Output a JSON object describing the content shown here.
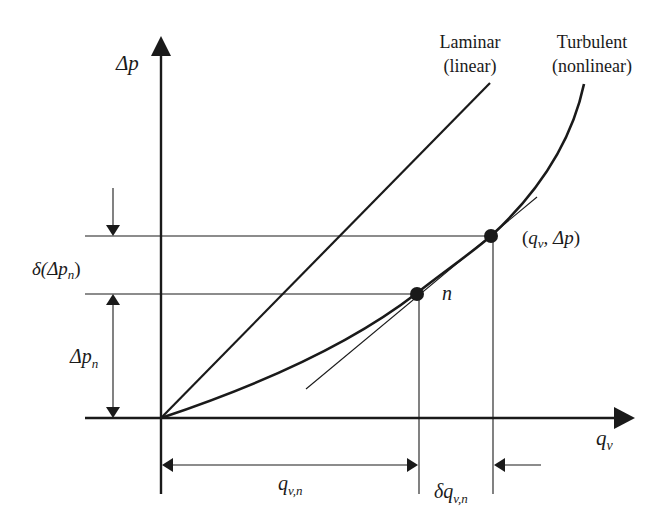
{
  "diagram": {
    "type": "pressure-flow characteristic with linearization",
    "axes": {
      "y_label": "Δp",
      "x_label_main": "q",
      "x_label_sub": "v"
    },
    "curves": {
      "laminar": {
        "line1": "Laminar",
        "line2": "(linear)"
      },
      "turbulent": {
        "line1": "Turbulent",
        "line2": "(nonlinear)"
      }
    },
    "points": {
      "operating_point": {
        "open": "(",
        "q": "q",
        "q_sub": "v",
        "sep": ", ",
        "dp": "Δp",
        "close": ")"
      },
      "point_n": {
        "label": "n"
      }
    },
    "dimensions": {
      "delta_dp_n": {
        "prefix": "δ(",
        "dp": "Δp",
        "sub": "n",
        "close": ")"
      },
      "dp_n": {
        "dp": "Δp",
        "sub": "n"
      },
      "q_vn": {
        "q": "q",
        "sub": "v,n"
      },
      "delta_q_vn": {
        "prefix": "δ",
        "q": "q",
        "sub": "v,n"
      }
    },
    "colors": {
      "ink": "#1a1a1a",
      "background": "#ffffff"
    }
  }
}
